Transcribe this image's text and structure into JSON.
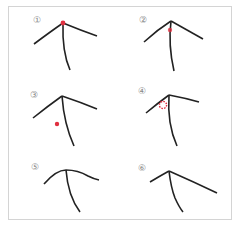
{
  "figure": {
    "border_color": "#d4d4d4",
    "stroke_color": "#222222",
    "marker_color": "#e03040",
    "panels": [
      {
        "label": "①",
        "marker": "dot at junction top"
      },
      {
        "label": "②",
        "marker": "dot just below junction on stem"
      },
      {
        "label": "③",
        "marker": "dot below-left of junction, detached"
      },
      {
        "label": "④",
        "marker": "dotted ring left of junction"
      },
      {
        "label": "⑤",
        "marker": "none"
      },
      {
        "label": "⑥",
        "marker": "none"
      }
    ]
  }
}
